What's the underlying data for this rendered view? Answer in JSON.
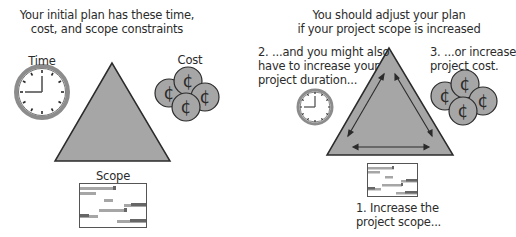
{
  "left_panel": {
    "title_line1": "Your initial plan has these time,",
    "title_line2": "cost, and scope constraints",
    "time_label": "Time",
    "cost_label": "Cost",
    "scope_label": "Scope",
    "coin_symbol": "¢"
  },
  "right_panel": {
    "title_line1": "You should adjust your plan",
    "title_line2": "if your  project scope is increased",
    "step2_line1": "2. ...and you might also",
    "step2_line2": "have to increase your",
    "step2_line3": "project duration...",
    "step3_line1": "3. ...or increase",
    "step3_line2": "project cost.",
    "step1_line1": "1. Increase the",
    "step1_line2": "project scope...",
    "coin_symbol": "¢"
  },
  "colors": {
    "triangle_fill": "#a6a6a6",
    "outline": "#2b2b2b",
    "coin_fill": "#a6a6a6",
    "clock_ring": "#8c8c8c",
    "gantt_bar": "#9a9a9a"
  }
}
